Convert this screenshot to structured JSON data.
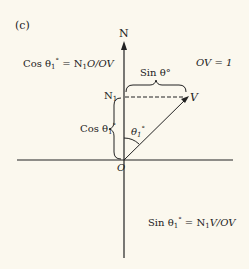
{
  "diagram": {
    "panel_label": "(c)",
    "north_label": "N",
    "origin_label": "O",
    "n1_label": "N",
    "n1_sub": "1",
    "v_label": "V",
    "angle_label": "θ",
    "angle_sub": "1",
    "angle_sup": "°",
    "ov_note": "OV = 1",
    "brace_top_label": "Sin θ°",
    "brace_left_label_prefix": "Cos θ",
    "cos_formula_prefix": "Cos θ",
    "cos_formula_rest": " = N",
    "cos_formula_tail": "O/OV",
    "sin_formula_prefix": "Sin θ",
    "sin_formula_rest": " = N",
    "sin_formula_tail": "V/OV",
    "colors": {
      "ink": "#222222",
      "background": "#fbf8ee"
    }
  }
}
